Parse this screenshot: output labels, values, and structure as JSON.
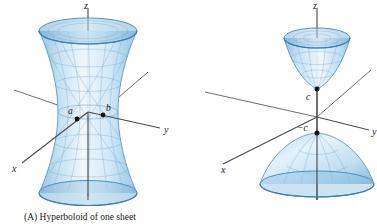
{
  "figure": {
    "background_color": "#ffffff",
    "surface_fill_light": "#eaf4fb",
    "surface_fill_mid": "#bcdcf0",
    "surface_fill_dark": "#7fb3d9",
    "mesh_color": "#6ea6cf",
    "axis_color": "#4a4a4a",
    "label_color": "#1a1a1a"
  },
  "panelA": {
    "caption": "(A) Hyperboloid of one sheet",
    "caption_prefix": "(A)",
    "axes": [
      {
        "name": "z-axis",
        "label": "z"
      },
      {
        "name": "y-axis",
        "label": "y"
      },
      {
        "name": "x-axis",
        "label": "x"
      }
    ],
    "axis_labels": {
      "z": "z",
      "y": "y",
      "x": "x"
    },
    "points": [
      {
        "name": "point-a",
        "label": "a"
      },
      {
        "name": "point-b",
        "label": "b"
      }
    ]
  },
  "panelB": {
    "caption": "(B) Hyperboloid of two sheets",
    "caption_prefix": "(B)",
    "axes": [
      {
        "name": "z-axis",
        "label": "z"
      },
      {
        "name": "y-axis",
        "label": "y"
      },
      {
        "name": "x-axis",
        "label": "x"
      }
    ],
    "axis_labels": {
      "z": "z",
      "y": "y",
      "x": "x"
    },
    "points": [
      {
        "name": "point-c",
        "label": "c"
      },
      {
        "name": "point-negative-c",
        "label": "−c"
      }
    ]
  }
}
